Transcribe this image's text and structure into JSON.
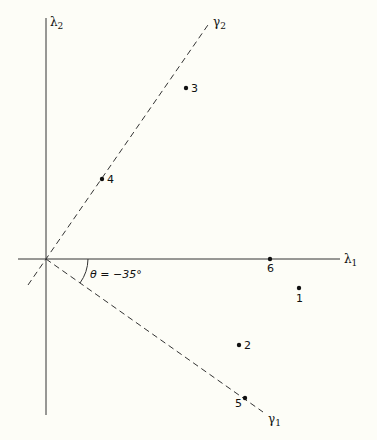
{
  "diagram": {
    "axes": {
      "lambda1": {
        "label": "λ",
        "subscript": "1"
      },
      "lambda2": {
        "label": "λ",
        "subscript": "2"
      }
    },
    "rotated_axes": {
      "gamma1": {
        "label": "γ",
        "subscript": "1"
      },
      "gamma2": {
        "label": "γ",
        "subscript": "2"
      }
    },
    "angle_label": "θ = −35°",
    "points": [
      {
        "id": "1",
        "label": "1",
        "x": 299,
        "y": 288,
        "label_pos": "below"
      },
      {
        "id": "2",
        "label": "2",
        "x": 239,
        "y": 345,
        "label_pos": "right"
      },
      {
        "id": "3",
        "label": "3",
        "x": 186,
        "y": 88,
        "label_pos": "right"
      },
      {
        "id": "4",
        "label": "4",
        "x": 102,
        "y": 179,
        "label_pos": "right"
      },
      {
        "id": "5",
        "label": "5",
        "x": 245,
        "y": 398,
        "label_pos": "left-below"
      },
      {
        "id": "6",
        "label": "6",
        "x": 270,
        "y": 259,
        "label_pos": "below"
      }
    ]
  }
}
